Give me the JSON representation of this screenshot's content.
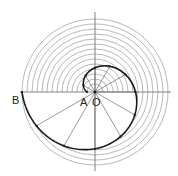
{
  "diagram": {
    "center": {
      "x": 95,
      "y": 92
    },
    "circles": {
      "count": 14,
      "r_min": 8,
      "r_step": 5,
      "color": "#9a9a9a"
    },
    "axes": {
      "h_from": 20,
      "h_to": 171,
      "v_from": 12,
      "v_to": 171,
      "color": "#666666"
    },
    "spiral": {
      "r_start": 8,
      "r_end": 73,
      "start_angle_deg": 180,
      "turn_deg": 360,
      "direction": "clockwise",
      "marks_every_deg": 30,
      "color": "#1a1a1a"
    },
    "labels": {
      "A": "A",
      "O": "O",
      "B": "B"
    }
  }
}
